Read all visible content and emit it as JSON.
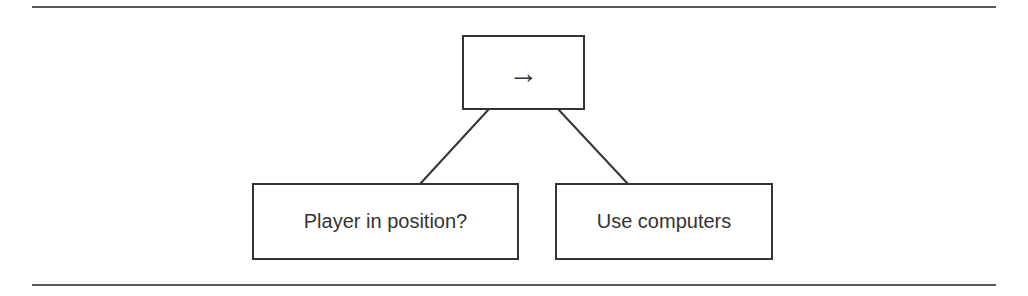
{
  "diagram": {
    "type": "behavior-tree",
    "root": {
      "label": "→",
      "kind": "sequence",
      "icon": "arrow-right-icon"
    },
    "children": [
      {
        "label": "Player in position?",
        "kind": "condition"
      },
      {
        "label": "Use computers",
        "kind": "action"
      }
    ],
    "edges": [
      {
        "from": "root",
        "to": "Player in position?"
      },
      {
        "from": "root",
        "to": "Use computers"
      }
    ]
  }
}
